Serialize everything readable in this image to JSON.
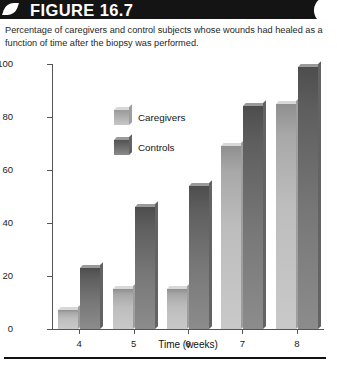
{
  "figure": {
    "banner_label": "FIGURE 16.7",
    "caption": "Percentage of caregivers and control subjects whose wounds had healed as a function of time after the biopsy was performed."
  },
  "footer": {
    "faint_text": ""
  },
  "chart_data": {
    "type": "bar",
    "title": "",
    "categories": [
      "4",
      "5",
      "6",
      "7",
      "8"
    ],
    "series": [
      {
        "name": "Caregivers",
        "values": [
          7,
          15,
          15,
          69,
          85
        ],
        "color": "#bdbdbd"
      },
      {
        "name": "Controls",
        "values": [
          23,
          46,
          54,
          84,
          99
        ],
        "color": "#6f6f6f"
      }
    ],
    "xlabel": "Time (weeks)",
    "ylabel": "Percent of subjects with fully healed wounds",
    "ylim": [
      0,
      100
    ],
    "yticks": [
      "0",
      "20",
      "40",
      "60",
      "80",
      "100"
    ],
    "grid": false,
    "legend_position": "upper-left-inside"
  }
}
